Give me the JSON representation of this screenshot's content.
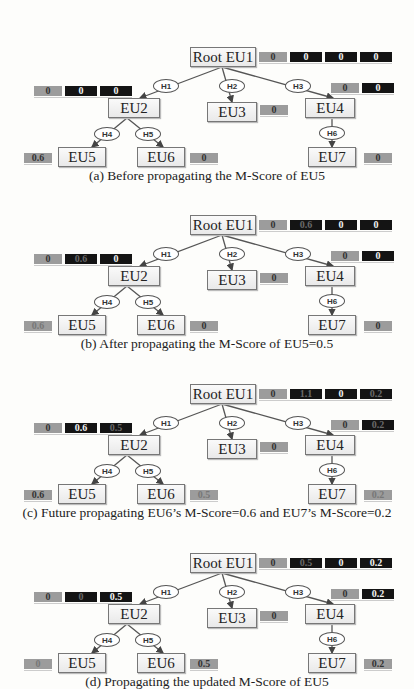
{
  "edge_labels": [
    "H1",
    "H2",
    "H3",
    "H4",
    "H5",
    "H6"
  ],
  "panels": [
    {
      "caption": "(a) Before propagating the M-Score of EU5",
      "nodes": {
        "eu1": "Root EU1",
        "eu2": "EU2",
        "eu3": "EU3",
        "eu4": "EU4",
        "eu5": "EU5",
        "eu6": "EU6",
        "eu7": "EU7"
      },
      "scores": {
        "eu1": [
          {
            "v": "0",
            "k": "gray"
          },
          {
            "v": "0",
            "k": "dark"
          },
          {
            "v": "0",
            "k": "dark"
          },
          {
            "v": "0",
            "k": "dark"
          }
        ],
        "eu2": [
          {
            "v": "0",
            "k": "gray"
          },
          {
            "v": "0",
            "k": "dark"
          },
          {
            "v": "0",
            "k": "dark"
          }
        ],
        "eu3": [
          {
            "v": "0",
            "k": "gray"
          }
        ],
        "eu4": [
          {
            "v": "0",
            "k": "gray"
          },
          {
            "v": "0",
            "k": "dark"
          }
        ],
        "eu5": [
          {
            "v": "0.6",
            "k": "gray"
          }
        ],
        "eu6": [
          {
            "v": "0",
            "k": "gray"
          }
        ],
        "eu7": [
          {
            "v": "0",
            "k": "gray"
          }
        ]
      }
    },
    {
      "caption": "(b) After propagating the M-Score of EU5=0.5",
      "nodes": {
        "eu1": "Root EU1",
        "eu2": "EU2",
        "eu3": "EU3",
        "eu4": "EU4",
        "eu5": "EU5",
        "eu6": "EU6",
        "eu7": "EU7"
      },
      "scores": {
        "eu1": [
          {
            "v": "0",
            "k": "gray"
          },
          {
            "v": "0.6",
            "k": "dark faded"
          },
          {
            "v": "0",
            "k": "dark"
          },
          {
            "v": "0",
            "k": "dark"
          }
        ],
        "eu2": [
          {
            "v": "0",
            "k": "gray"
          },
          {
            "v": "0.6",
            "k": "dark faded"
          },
          {
            "v": "0",
            "k": "dark"
          }
        ],
        "eu3": [
          {
            "v": "0",
            "k": "gray"
          }
        ],
        "eu4": [
          {
            "v": "0",
            "k": "gray"
          },
          {
            "v": "0",
            "k": "dark"
          }
        ],
        "eu5": [
          {
            "v": "0.6",
            "k": "gray faded"
          }
        ],
        "eu6": [
          {
            "v": "0",
            "k": "gray"
          }
        ],
        "eu7": [
          {
            "v": "0",
            "k": "gray"
          }
        ]
      }
    },
    {
      "caption": "(c) Future propagating EU6’s M-Score=0.6 and EU7’s M-Score=0.2",
      "nodes": {
        "eu1": "Root EU1",
        "eu2": "EU2",
        "eu3": "EU3",
        "eu4": "EU4",
        "eu5": "EU5",
        "eu6": "EU6",
        "eu7": "EU7"
      },
      "scores": {
        "eu1": [
          {
            "v": "0",
            "k": "gray"
          },
          {
            "v": "1.1",
            "k": "dark faded"
          },
          {
            "v": "0",
            "k": "dark"
          },
          {
            "v": "0.2",
            "k": "dark faded"
          }
        ],
        "eu2": [
          {
            "v": "0",
            "k": "gray"
          },
          {
            "v": "0.6",
            "k": "dark"
          },
          {
            "v": "0.5",
            "k": "dark faded"
          }
        ],
        "eu3": [
          {
            "v": "0",
            "k": "gray"
          }
        ],
        "eu4": [
          {
            "v": "0",
            "k": "gray"
          },
          {
            "v": "0.2",
            "k": "dark faded"
          }
        ],
        "eu5": [
          {
            "v": "0.6",
            "k": "gray"
          }
        ],
        "eu6": [
          {
            "v": "0.5",
            "k": "gray faded"
          }
        ],
        "eu7": [
          {
            "v": "0.2",
            "k": "gray faded"
          }
        ]
      }
    },
    {
      "caption": "(d) Propagating the updated M-Score of EU5",
      "nodes": {
        "eu1": "Root EU1",
        "eu2": "EU2",
        "eu3": "EU3",
        "eu4": "EU4",
        "eu5": "EU5",
        "eu6": "EU6",
        "eu7": "EU7"
      },
      "scores": {
        "eu1": [
          {
            "v": "0",
            "k": "gray"
          },
          {
            "v": "0.5",
            "k": "dark faded"
          },
          {
            "v": "0",
            "k": "dark"
          },
          {
            "v": "0.2",
            "k": "dark"
          }
        ],
        "eu2": [
          {
            "v": "0",
            "k": "gray"
          },
          {
            "v": "0",
            "k": "dark faded"
          },
          {
            "v": "0.5",
            "k": "dark"
          }
        ],
        "eu3": [
          {
            "v": "0",
            "k": "gray"
          }
        ],
        "eu4": [
          {
            "v": "0",
            "k": "gray"
          },
          {
            "v": "0.2",
            "k": "dark"
          }
        ],
        "eu5": [
          {
            "v": "0",
            "k": "gray faded"
          }
        ],
        "eu6": [
          {
            "v": "0.5",
            "k": "gray"
          }
        ],
        "eu7": [
          {
            "v": "0.2",
            "k": "gray"
          }
        ]
      }
    }
  ]
}
